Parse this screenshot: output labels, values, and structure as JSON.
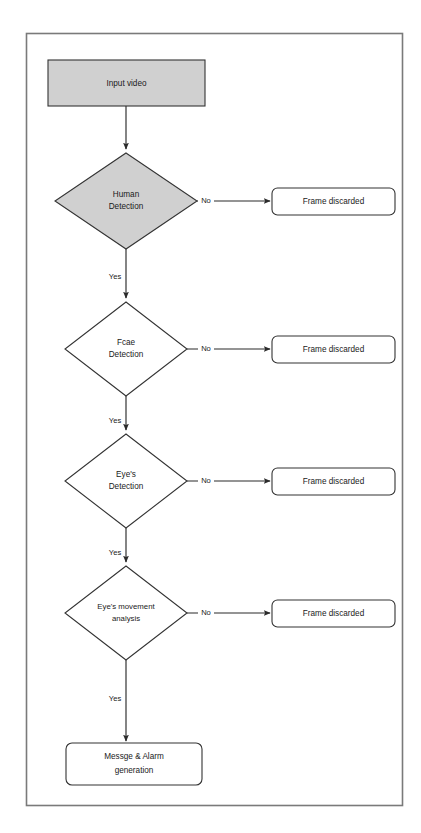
{
  "figure": {
    "kind": "flowchart",
    "background_color": "#ffffff",
    "frame": {
      "border_color": "#7a7a7a",
      "x": 26,
      "y": 33,
      "width": 377,
      "height": 773
    }
  },
  "palette": {
    "highlight_fill": "#d0d0d0",
    "plain_fill": "#ffffff",
    "stroke": "#333333",
    "connector": "#2b2b2b",
    "text": "#1a1a1a"
  },
  "nodes": {
    "input_video": {
      "label": "Input video",
      "shape": "rectangle",
      "fill": "#d0d0d0",
      "x": 48,
      "y": 60,
      "width": 157,
      "height": 46
    },
    "human_detection": {
      "label_line1": "Human",
      "label_line2": "Detection",
      "shape": "diamond",
      "fill": "#d0d0d0",
      "cx": 126,
      "cy": 201,
      "rx": 71,
      "ry": 48
    },
    "face_detection": {
      "label_line1": "Fcae",
      "label_line2": "Detection",
      "shape": "diamond",
      "fill": "#ffffff",
      "cx": 126,
      "cy": 349,
      "rx": 61,
      "ry": 47
    },
    "eyes_detection": {
      "label_line1": "Eye's",
      "label_line2": "Detection",
      "shape": "diamond",
      "fill": "#ffffff",
      "cx": 126,
      "cy": 481,
      "rx": 61,
      "ry": 47
    },
    "eye_movement_analysis": {
      "label_line1": "Eye's movement",
      "label_line2": "analysis",
      "shape": "diamond",
      "fill": "#ffffff",
      "cx": 126,
      "cy": 613,
      "rx": 61,
      "ry": 47
    },
    "message_alarm": {
      "label_line1": "Messge & Alarm",
      "label_line2": "generation",
      "shape": "rounded-rectangle",
      "fill": "#ffffff",
      "x": 66,
      "y": 743,
      "width": 136,
      "height": 42
    }
  },
  "discard_nodes": [
    {
      "id": "frame-discarded-1",
      "label": "Frame discarded",
      "x": 272,
      "y": 188,
      "width": 123,
      "height": 27
    },
    {
      "id": "frame-discarded-2",
      "label": "Frame discarded",
      "x": 272,
      "y": 336,
      "width": 123,
      "height": 27
    },
    {
      "id": "frame-discarded-3",
      "label": "Frame discarded",
      "x": 272,
      "y": 468,
      "width": 123,
      "height": 27
    },
    {
      "id": "frame-discarded-4",
      "label": "Frame discarded",
      "x": 272,
      "y": 600,
      "width": 123,
      "height": 27
    }
  ],
  "edges": {
    "no_label": "No",
    "yes_label": "Yes",
    "branches": [
      {
        "from": "human_detection",
        "no_to": "frame-discarded-1",
        "yes_to": "face_detection"
      },
      {
        "from": "face_detection",
        "no_to": "frame-discarded-2",
        "yes_to": "eyes_detection"
      },
      {
        "from": "eyes_detection",
        "no_to": "frame-discarded-3",
        "yes_to": "eye_movement_analysis"
      },
      {
        "from": "eye_movement_analysis",
        "no_to": "frame-discarded-4",
        "yes_to": "message_alarm"
      }
    ],
    "no_labels_positions": [
      {
        "x": 206,
        "y": 201
      },
      {
        "x": 206,
        "y": 349
      },
      {
        "x": 206,
        "y": 481
      },
      {
        "x": 206,
        "y": 613
      }
    ],
    "yes_labels_positions": [
      {
        "x": 115,
        "y": 277
      },
      {
        "x": 115,
        "y": 421
      },
      {
        "x": 115,
        "y": 553
      },
      {
        "x": 115,
        "y": 699
      }
    ]
  }
}
